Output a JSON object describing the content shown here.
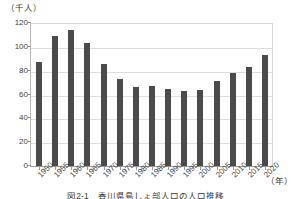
{
  "chart_data": {
    "type": "bar",
    "title": "",
    "caption": "図2-1　香川県島しょ部人口の人口推移",
    "xlabel": "（年）",
    "ylabel": "（千人）",
    "ylim": [
      0,
      120
    ],
    "ytick_interval": 20,
    "yticks": [
      "120",
      "100",
      "80",
      "60",
      "40",
      "20",
      "0"
    ],
    "grid": true,
    "legend": "none",
    "bar_color": "#4b4b4b",
    "grid_color": "#dcdcdc",
    "axis_color": "#9a9a9a",
    "categories": [
      "1950",
      "1955",
      "1960",
      "1965",
      "1970",
      "1975",
      "1980",
      "1985",
      "1990",
      "1995",
      "2000",
      "2005",
      "2010",
      "2015",
      "2020"
    ],
    "values": [
      87,
      109,
      114,
      103,
      86,
      73,
      66,
      67,
      65,
      63,
      64,
      71,
      78,
      83,
      93
    ]
  }
}
